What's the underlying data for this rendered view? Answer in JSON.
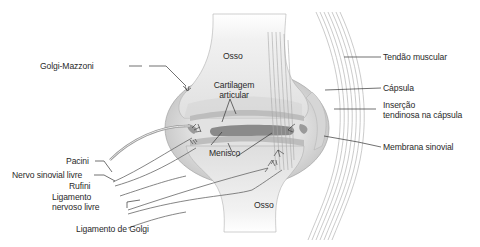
{
  "diagram": {
    "type": "anatomical-illustration",
    "labels": {
      "golgi_mazzoni": "Golgi-Mazzoni",
      "pacini": "Pacini",
      "nervo_sinovial_livre": "Nervo sinovial livre",
      "rufini": "Rufini",
      "ligamento_nervoso_livre_1": "Ligamento",
      "ligamento_nervoso_livre_2": "nervoso livre",
      "ligamento_de_golgi": "Ligamento de Golgi",
      "osso_top": "Osso",
      "cartilagem_1": "Cartilagem",
      "cartilagem_2": "articular",
      "menisco": "Menisco",
      "osso_bottom": "Osso",
      "tendao_muscular": "Tendão muscular",
      "capsula": "Cápsula",
      "insercao_1": "Inserção",
      "insercao_2": "tendinosa na cápsula",
      "membrana_sinovial": "Membrana sinovial"
    },
    "colors": {
      "bone": "#ececec",
      "bone_shade": "#d2d2d2",
      "capsule": "#c9c9c9",
      "cartilage": "#9a9a9a",
      "meniscus": "#7d7d7d",
      "tendon_line": "#a8a8a8",
      "leader_line": "#333333",
      "text": "#2a2a2a"
    }
  }
}
